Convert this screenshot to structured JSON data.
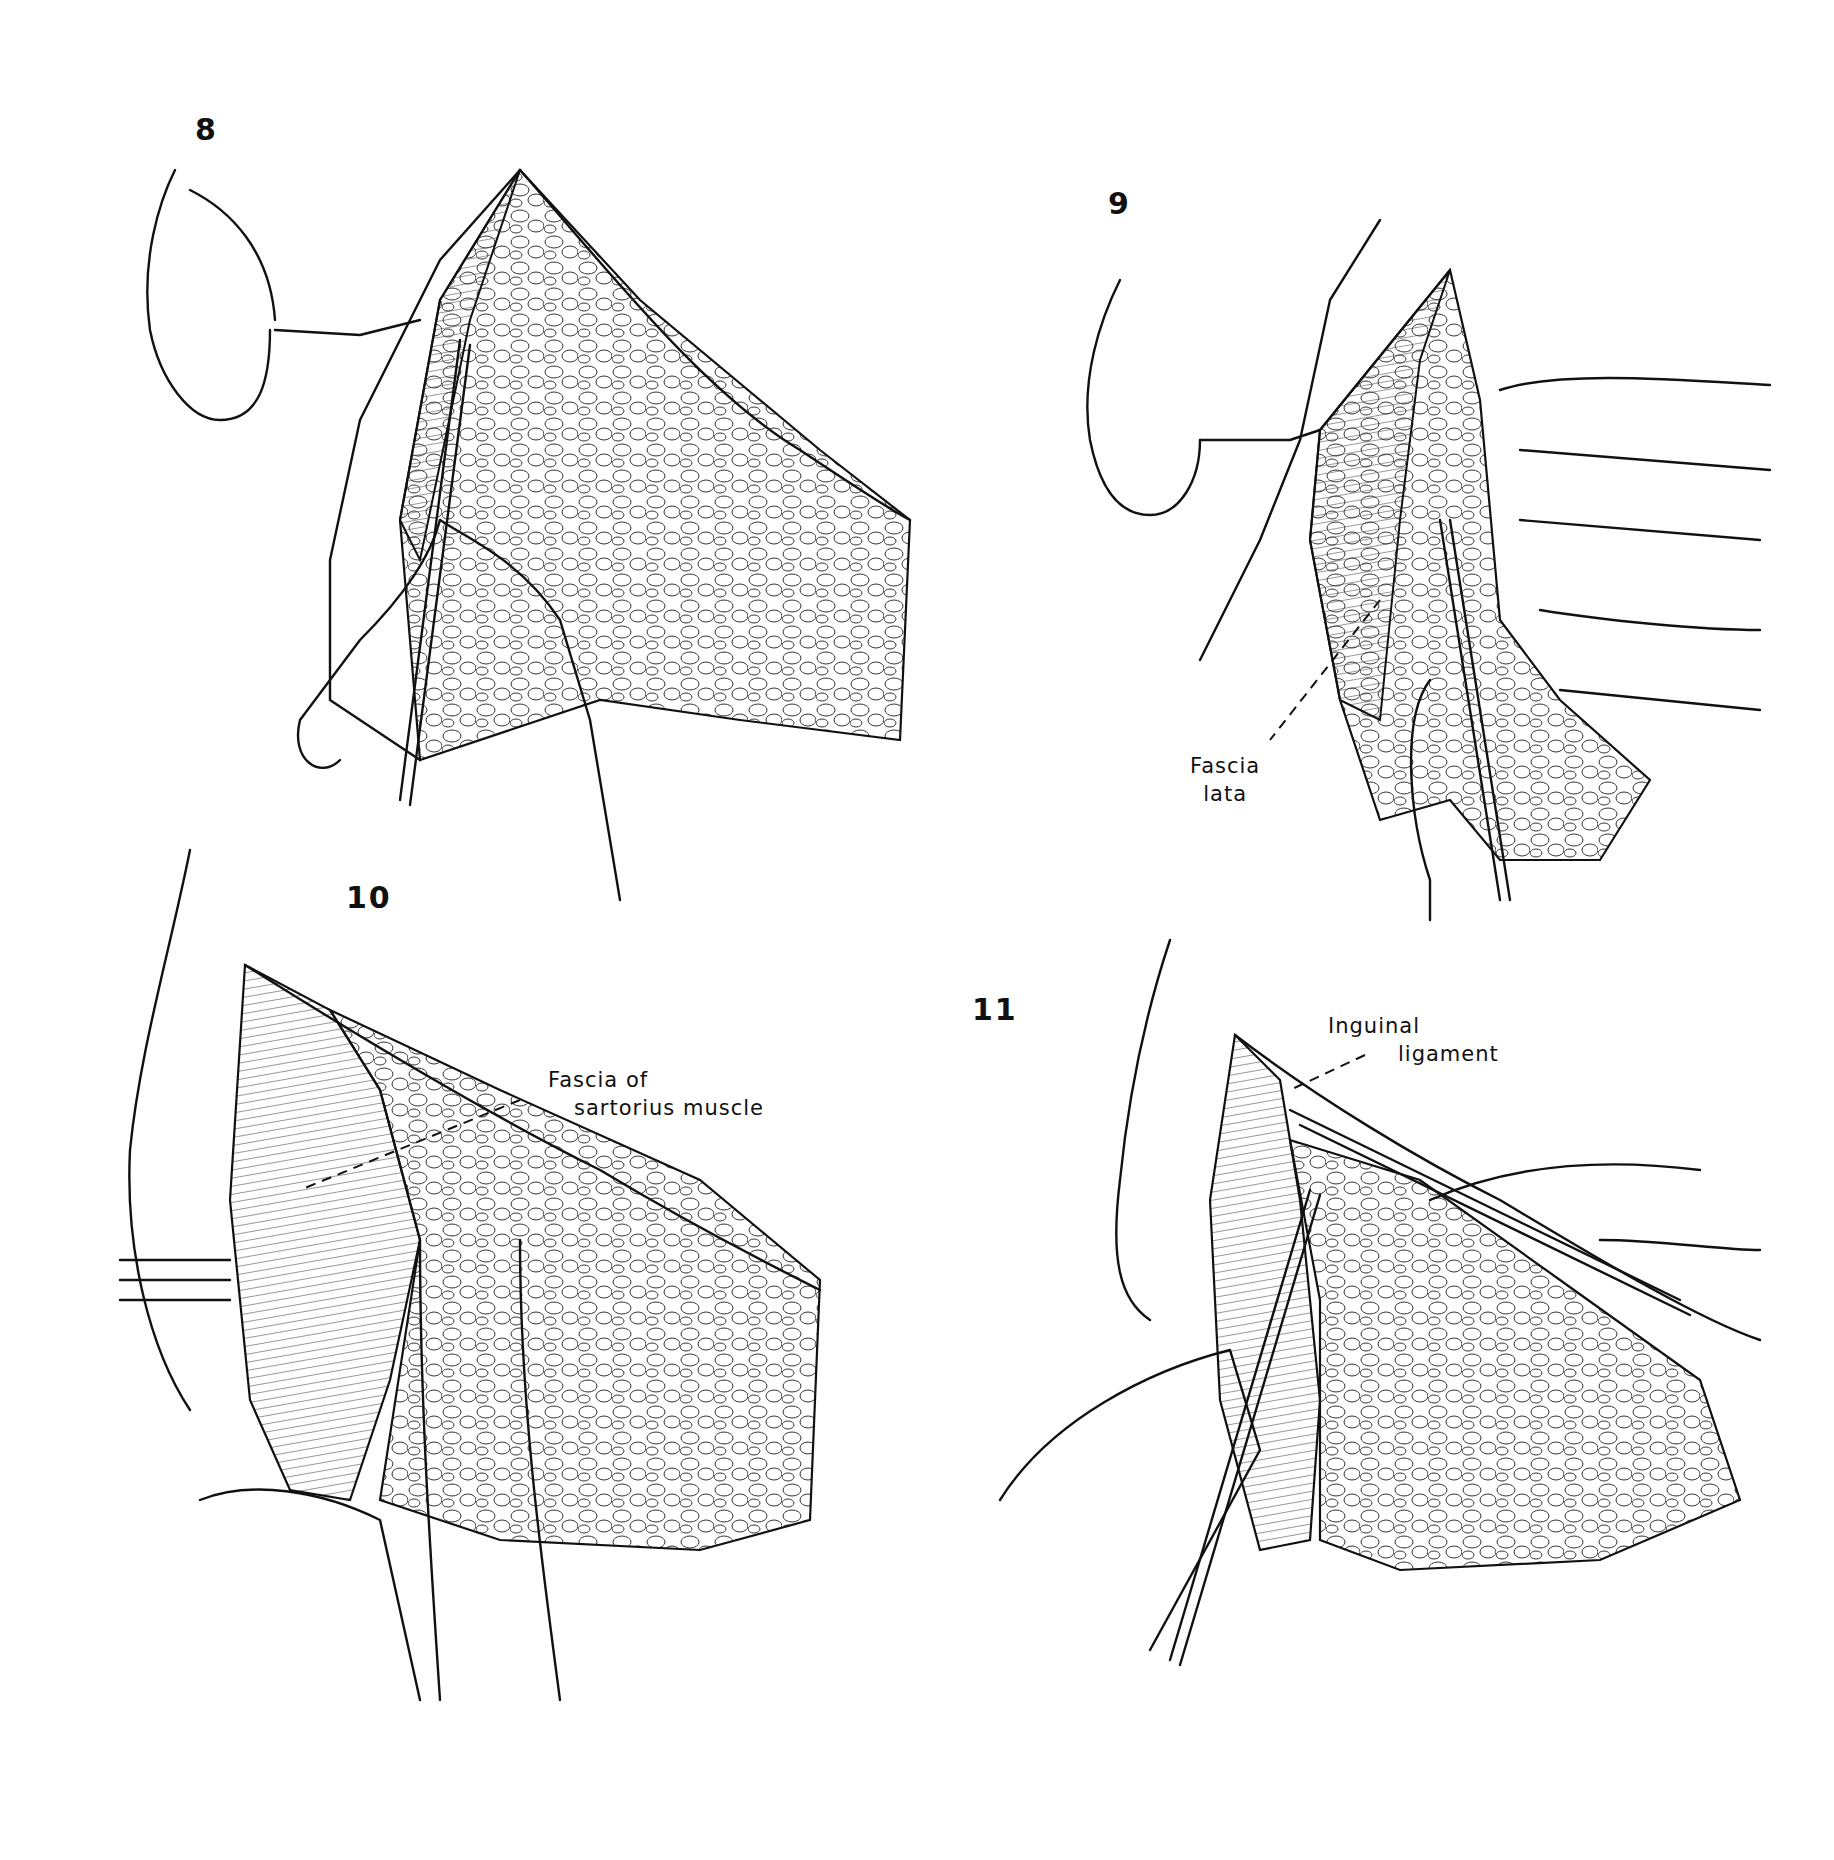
{
  "figure": {
    "panels": [
      {
        "number": "8",
        "labels": []
      },
      {
        "number": "9",
        "labels": [
          {
            "line1": "Fascia",
            "line2": "lata"
          }
        ]
      },
      {
        "number": "10",
        "labels": [
          {
            "line1": "Fascia of",
            "line2": "sartorius muscle"
          }
        ]
      },
      {
        "number": "11",
        "labels": [
          {
            "line1": "Inguinal",
            "line2": "ligament"
          }
        ]
      }
    ]
  }
}
